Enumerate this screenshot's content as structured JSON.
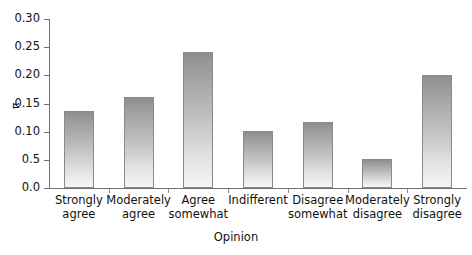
{
  "chart_data": {
    "type": "bar",
    "title": "",
    "xlabel": "Opinion",
    "ylabel": "π",
    "categories": [
      "Strongly agree",
      "Moderately agree",
      "Agree somewhat",
      "Indifferent",
      "Disagree somewhat",
      "Moderately disagree",
      "Strongly disagree"
    ],
    "category_lines": [
      [
        "Strongly",
        "agree"
      ],
      [
        "Moderately",
        "agree"
      ],
      [
        "Agree",
        "somewhat"
      ],
      [
        "Indifferent",
        ""
      ],
      [
        "Disagree",
        "somewhat"
      ],
      [
        "Moderately",
        "disagree"
      ],
      [
        "Strongly",
        "disagree"
      ]
    ],
    "values": [
      0.136,
      0.161,
      0.241,
      0.101,
      0.118,
      0.051,
      0.201
    ],
    "ylim": [
      0.0,
      0.3
    ],
    "ytick_values": [
      0.3,
      0.25,
      0.2,
      0.15,
      0.1,
      0.05,
      0.0
    ],
    "ytick_labels": [
      "0.30",
      "0.25",
      "0.20",
      "0.15",
      "0.10",
      "0.5",
      "0.0"
    ],
    "grid": false,
    "legend": null,
    "bar_fill": "#b4b4b4",
    "bar_edge": "#8a8a8a",
    "axis_color": "#6f6f6f",
    "background": "#ffffff"
  }
}
